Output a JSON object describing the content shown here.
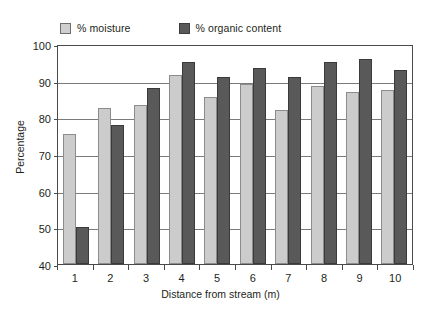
{
  "chart_data": {
    "type": "bar",
    "title": "",
    "xlabel": "Distance from stream (m)",
    "ylabel": "Percentage",
    "categories": [
      "1",
      "2",
      "3",
      "4",
      "5",
      "6",
      "7",
      "8",
      "9",
      "10"
    ],
    "series": [
      {
        "name": "% moisture",
        "color": "#cccccc",
        "values": [
          75.5,
          82.5,
          83.5,
          91.5,
          85.5,
          89,
          82,
          88.5,
          87,
          87.5
        ]
      },
      {
        "name": "% organic content",
        "color": "#595959",
        "values": [
          50,
          78,
          88,
          95,
          91,
          93.5,
          91,
          95,
          96,
          93
        ]
      }
    ],
    "ylim": [
      40,
      100
    ],
    "yticks": [
      40,
      50,
      60,
      70,
      80,
      90,
      100
    ],
    "ytick_labels": [
      "40",
      "50",
      "60",
      "70",
      "80",
      "90",
      "100"
    ],
    "grid": true,
    "legend_position": "top-left"
  },
  "legend": {
    "items": [
      {
        "label": "% moisture",
        "swatch": "moisture-swatch"
      },
      {
        "label": "% organic content",
        "swatch": "organic-swatch"
      }
    ]
  }
}
